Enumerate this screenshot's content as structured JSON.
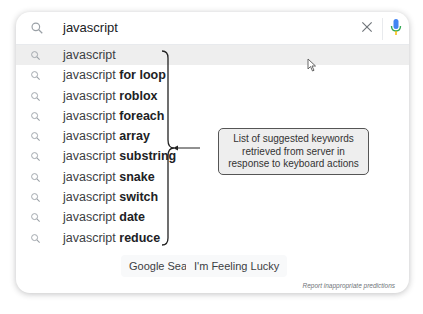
{
  "search": {
    "query": "javascript",
    "icon": "search-icon",
    "clear_icon": "close-icon",
    "mic_icon": "mic-icon"
  },
  "suggestions": [
    {
      "prefix": "javascript",
      "bold": ""
    },
    {
      "prefix": "javascript ",
      "bold": "for loop"
    },
    {
      "prefix": "javascript ",
      "bold": "roblox"
    },
    {
      "prefix": "javascript ",
      "bold": "foreach"
    },
    {
      "prefix": "javascript ",
      "bold": "array"
    },
    {
      "prefix": "javascript ",
      "bold": "substring"
    },
    {
      "prefix": "javascript ",
      "bold": "snake"
    },
    {
      "prefix": "javascript ",
      "bold": "switch"
    },
    {
      "prefix": "javascript ",
      "bold": "date"
    },
    {
      "prefix": "javascript ",
      "bold": "reduce"
    }
  ],
  "buttons": {
    "google_search": "Google Search",
    "feeling_lucky": "I'm Feeling Lucky"
  },
  "report_link": "Report inappropriate predictions",
  "annotation": {
    "lines": [
      "List of suggested keywords",
      "retrieved from server in",
      "response to keyboard actions"
    ]
  }
}
